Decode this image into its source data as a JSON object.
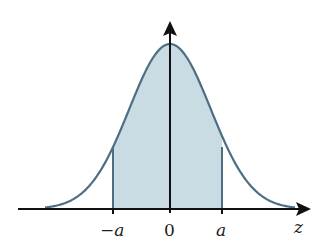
{
  "diagram": {
    "type": "standard-normal-distribution",
    "colors": {
      "curve": "#4d6f86",
      "fill": "#c9dbe3",
      "axis": "#111111",
      "background": "#ffffff"
    },
    "axis_labels": {
      "x": "z"
    },
    "tick_labels": {
      "neg_a": "−a",
      "zero": "0",
      "pos_a": "a"
    },
    "shaded_region": {
      "from": "−a",
      "to": "a"
    }
  },
  "chart_data": {
    "type": "area",
    "title": "",
    "xlabel": "z",
    "ylabel": "",
    "tick_labels": [
      "−a",
      "0",
      "a"
    ],
    "shaded_interval": [
      "−a",
      "a"
    ],
    "curve": "standard normal density",
    "grid": false
  }
}
